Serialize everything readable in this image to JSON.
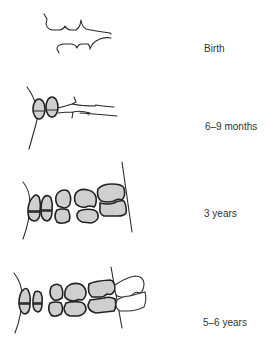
{
  "figure": {
    "stages": [
      {
        "label": "Birth"
      },
      {
        "label": "6–9 months"
      },
      {
        "label": "3 years"
      },
      {
        "label": "5–6 years"
      }
    ],
    "colors": {
      "primary_tooth_fill": "#cfcfcf",
      "outline": "#222222",
      "permanent_tooth_fill": "#ffffff"
    }
  }
}
